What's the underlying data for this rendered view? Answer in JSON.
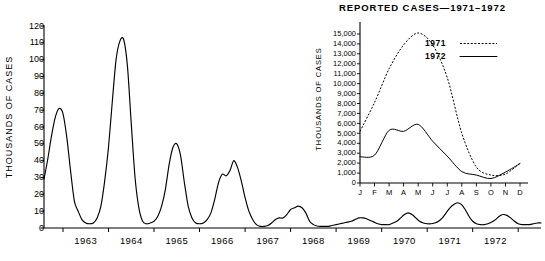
{
  "chart_data": [
    {
      "id": "main",
      "type": "line",
      "title": "",
      "xlabel": "",
      "ylabel": "THOUSANDS OF CASES",
      "ylim": [
        0,
        120
      ],
      "ytick_labels": [
        "120",
        "110",
        "100",
        "90",
        "80",
        "70",
        "60",
        "50",
        "40",
        "30",
        "20",
        "10",
        "0"
      ],
      "ytick_values": [
        120,
        110,
        100,
        90,
        80,
        70,
        60,
        50,
        40,
        30,
        20,
        10,
        0
      ],
      "xtick_labels": [
        "1963",
        "1964",
        "1965",
        "1966",
        "1967",
        "1968",
        "1969",
        "1970",
        "1971",
        "1972"
      ],
      "grid": false,
      "legend": "none",
      "series": [
        {
          "name": "Reported cases (monthly, thousands)",
          "style": "solid",
          "x_start": 1962.55,
          "x_step": 0.0833,
          "values": [
            29,
            41,
            55,
            66,
            71,
            68,
            54,
            34,
            16,
            10,
            5,
            3,
            2.5,
            3,
            6,
            13,
            28,
            48,
            75,
            100,
            111,
            112,
            96,
            62,
            30,
            12,
            4,
            2.5,
            3,
            4,
            7,
            13,
            23,
            38,
            48,
            50,
            43,
            27,
            13,
            6,
            3,
            2.5,
            3,
            5,
            9,
            17,
            27,
            32,
            31,
            34,
            40,
            36,
            28,
            18,
            10,
            5,
            2,
            1,
            1,
            1.5,
            3,
            5,
            6,
            6,
            8,
            11,
            12,
            13,
            12,
            9,
            4,
            2,
            1.2,
            1,
            1,
            1,
            1.5,
            2,
            2.5,
            3,
            3.5,
            4,
            5,
            6,
            6,
            5.5,
            4.5,
            3.5,
            2.5,
            2,
            2,
            2,
            3,
            4,
            6,
            8,
            9,
            8,
            6,
            4,
            3,
            2.5,
            2.5,
            3,
            4,
            6,
            9,
            12,
            14,
            15,
            14,
            11,
            7,
            4,
            2.5,
            2,
            2,
            2.5,
            3.5,
            5,
            7,
            8,
            7.5,
            6,
            4,
            2.5,
            2,
            2,
            2,
            2.5,
            3,
            3
          ]
        }
      ]
    },
    {
      "id": "inset",
      "type": "line",
      "title": "REPORTED CASES—1971–1972",
      "xlabel": "",
      "ylabel": "THOUSANDS OF CASES",
      "ylim": [
        0,
        15000
      ],
      "ytick_labels": [
        "15,000",
        "14,000",
        "13,000",
        "12,000",
        "11,000",
        "10,000",
        "9,000",
        "8,000",
        "7,000",
        "6,000",
        "5,000",
        "4,000",
        "3,000",
        "2,000",
        "1,000",
        "0"
      ],
      "ytick_values": [
        15000,
        14000,
        13000,
        12000,
        11000,
        10000,
        9000,
        8000,
        7000,
        6000,
        5000,
        4000,
        3000,
        2000,
        1000,
        0
      ],
      "categories": [
        "J",
        "F",
        "M",
        "A",
        "M",
        "J",
        "J",
        "A",
        "S",
        "O",
        "N",
        "D"
      ],
      "grid": false,
      "legend_position": "upper-right",
      "series": [
        {
          "name": "1971",
          "style": "dashed",
          "values": [
            5200,
            8100,
            11500,
            13900,
            15100,
            13900,
            10600,
            5000,
            1600,
            800,
            900,
            2000
          ]
        },
        {
          "name": "1972",
          "style": "solid",
          "values": [
            2650,
            2800,
            5300,
            5200,
            5900,
            4200,
            2700,
            1150,
            800,
            450,
            1100,
            1950
          ]
        }
      ]
    }
  ],
  "main_chart": {
    "y_axis_label": "THOUSANDS OF CASES",
    "y_ticks": [
      "120",
      "110",
      "100",
      "90",
      "80",
      "70",
      "60",
      "50",
      "40",
      "30",
      "20",
      "10",
      "0"
    ],
    "x_ticks": [
      "1963",
      "1964",
      "1965",
      "1966",
      "1967",
      "1968",
      "1969",
      "1970",
      "1971",
      "1972"
    ]
  },
  "inset_chart": {
    "title": "REPORTED CASES—1971–1972",
    "y_axis_label": "THOUSANDS OF CASES",
    "y_ticks": [
      "15,000",
      "14,000",
      "13,000",
      "12,000",
      "11,000",
      "10,000",
      "9,000",
      "8,000",
      "7,000",
      "6,000",
      "5,000",
      "4,000",
      "3,000",
      "2,000",
      "1,000",
      "0"
    ],
    "x_ticks": [
      "J",
      "F",
      "M",
      "A",
      "M",
      "J",
      "J",
      "A",
      "S",
      "O",
      "N",
      "D"
    ],
    "legend": [
      {
        "label": "1971",
        "style": "dashed"
      },
      {
        "label": "1972",
        "style": "solid"
      }
    ]
  },
  "colors": {
    "ink": "#000000",
    "background": "#ffffff"
  }
}
